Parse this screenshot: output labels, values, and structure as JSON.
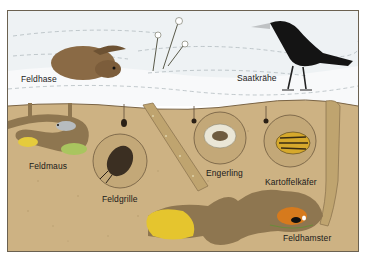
{
  "colors": {
    "sky": "#e9eef1",
    "snow": "#f6f7f8",
    "soil": "#c9ad7d",
    "soil_dark": "#9c8258",
    "tunnel": "#8e7650",
    "frame": "#6b6150",
    "nest_yellow": "#e6c62a",
    "nest_green": "#a7c35a"
  },
  "labels": {
    "feldhase": "Feldhase",
    "saatkraehe": "Saatkrähe",
    "feldmaus": "Feldmaus",
    "feldgrille": "Feldgrille",
    "engerling": "Engerling",
    "kartoffelkaefer": "Kartoffelkäfer",
    "feldhamster": "Feldhamster"
  },
  "animals": [
    {
      "name": "Feldhase",
      "zone": "above-ground",
      "icon": "hare-icon"
    },
    {
      "name": "Saatkrähe",
      "zone": "above-ground",
      "icon": "crow-icon"
    },
    {
      "name": "Feldmaus",
      "zone": "underground",
      "icon": "mouse-icon"
    },
    {
      "name": "Feldgrille",
      "zone": "underground",
      "icon": "cricket-icon"
    },
    {
      "name": "Engerling",
      "zone": "underground",
      "icon": "grub-icon"
    },
    {
      "name": "Kartoffelkäfer",
      "zone": "underground",
      "icon": "potato-beetle-icon"
    },
    {
      "name": "Feldhamster",
      "zone": "underground",
      "icon": "hamster-icon"
    }
  ]
}
